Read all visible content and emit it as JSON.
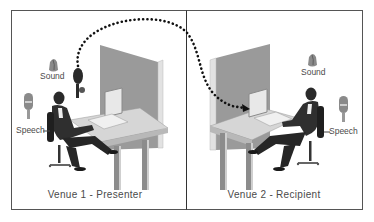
{
  "diagram": {
    "title": "",
    "venues": [
      {
        "id": "venue-1",
        "caption": "Venue 1 - Presenter",
        "role": "presenter",
        "labels": {
          "sound": "Sound",
          "speech": "Speech"
        }
      },
      {
        "id": "venue-2",
        "caption": "Venue 2 - Recipient",
        "role": "recipient",
        "labels": {
          "sound": "Sound",
          "speech": "Speech"
        }
      }
    ],
    "connector": {
      "style": "dotted-arrow",
      "from": "venue-1 presenter camera/speaker",
      "to": "venue-2 monitor"
    },
    "icons": {
      "sound": "speaker-icon",
      "speech": "microphone-icon"
    },
    "colors": {
      "frame": "#555555",
      "panel": "#9a9a9a",
      "panel_edge": "#e2e2e2",
      "desk_top": "#d6d6d6",
      "desk_leg": "#8c8c8c",
      "figure": "#2a2a2a",
      "arrow": "#111111",
      "text": "#4a4a4a"
    }
  }
}
